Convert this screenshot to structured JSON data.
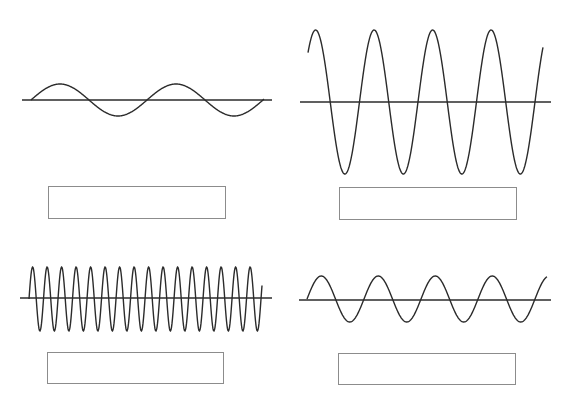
{
  "figure": {
    "background": "#ffffff",
    "stroke_color": "#2b2b2b",
    "axis_color": "#2b2b2b",
    "box_border_color": "#8c8c8c"
  },
  "panels": [
    {
      "id": "wave-a",
      "description": "low frequency, low amplitude",
      "axis": {
        "x1": 22,
        "x2": 272,
        "y": 100
      },
      "wave": {
        "x_start": 31,
        "x_end": 264,
        "baseline": 100,
        "amplitude": 16,
        "period": 116,
        "phase": 0
      },
      "cycles_approx": 2,
      "answer_box": {
        "x": 48,
        "y": 186,
        "w": 178,
        "h": 33,
        "text": ""
      }
    },
    {
      "id": "wave-b",
      "description": "medium frequency, high amplitude",
      "axis": {
        "x1": 300,
        "x2": 551,
        "y": 102
      },
      "wave": {
        "x_start": 308,
        "x_end": 543,
        "baseline": 102,
        "amplitude": 72,
        "period": 58.5,
        "phase": 0.12
      },
      "cycles_approx": 4,
      "answer_box": {
        "x": 339,
        "y": 187,
        "w": 178,
        "h": 33,
        "text": ""
      }
    },
    {
      "id": "wave-c",
      "description": "high frequency, medium amplitude",
      "axis": {
        "x1": 20,
        "x2": 272,
        "y": 298
      },
      "wave": {
        "x_start": 29,
        "x_end": 262,
        "baseline": 299,
        "amplitude": 32,
        "period": 14.5,
        "phase": 0
      },
      "cycles_approx": 16,
      "answer_box": {
        "x": 47,
        "y": 352,
        "w": 177,
        "h": 32,
        "text": ""
      }
    },
    {
      "id": "wave-d",
      "description": "medium frequency, low amplitude",
      "axis": {
        "x1": 299,
        "x2": 551,
        "y": 300
      },
      "wave": {
        "x_start": 307,
        "x_end": 547,
        "baseline": 299,
        "amplitude": 23,
        "period": 57,
        "phase": 0
      },
      "cycles_approx": 4,
      "answer_box": {
        "x": 338,
        "y": 353,
        "w": 178,
        "h": 32,
        "text": ""
      }
    }
  ]
}
